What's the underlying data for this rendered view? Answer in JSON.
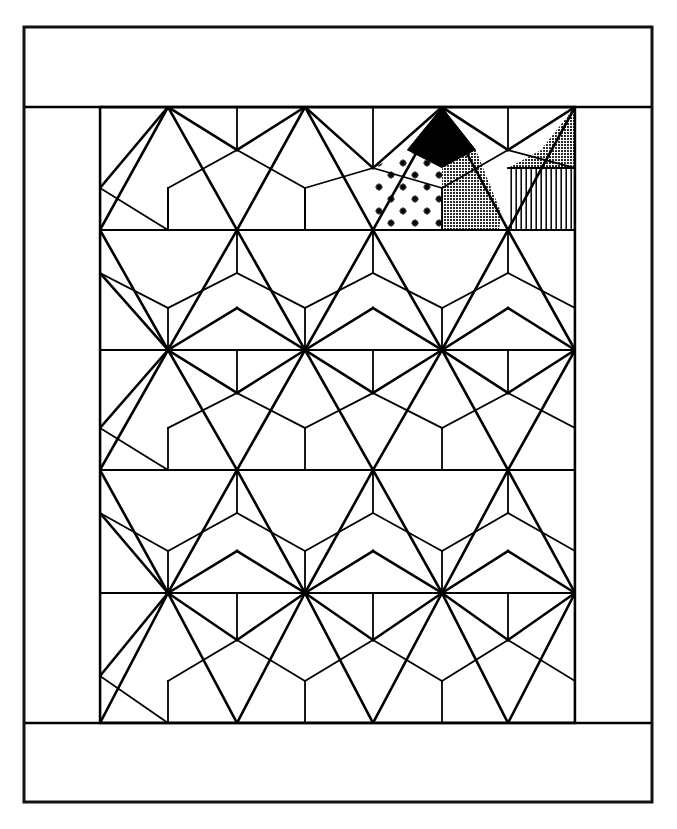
{
  "figure": {
    "kind": "line-drawing",
    "title": "",
    "caption": "",
    "background_color": "#ffffff",
    "ink_color": "#000000"
  },
  "frame": {
    "name": "outer-rectangle-border",
    "x": 24,
    "y": 27,
    "width": 628,
    "height": 775,
    "stroke_width": 3,
    "stroke_color": "#111111",
    "fill": "#ffffff"
  },
  "bands": {
    "top_band": {
      "label": "top blank band",
      "y": 27,
      "height": 80
    },
    "bottom_band": {
      "label": "bottom blank band",
      "y": 723,
      "height": 79
    }
  },
  "pattern": {
    "name": "tessellation-panel",
    "x": 100,
    "y": 107,
    "width": 475,
    "height": 616,
    "stroke_color": "#000000",
    "thin_stroke": 1.6,
    "thick_stroke": 3.0,
    "columns": 4,
    "rows": 5,
    "cell_width": 118.75,
    "cell_height": 123.2,
    "tile_types": [
      "hexagon",
      "triangle",
      "rhombus",
      "square"
    ],
    "grid_lines_horizontal": [
      107,
      230,
      350,
      470,
      593,
      723
    ],
    "grid_lines_vertical": [
      100,
      237,
      373,
      508,
      575
    ],
    "vertex_crossings_x": [
      168,
      305,
      442,
      575
    ]
  },
  "shaded_cells": [
    {
      "name": "black-triangle",
      "fill_style": "solid-black",
      "color": "#000000",
      "position": "upper-middle-right",
      "apex": [
        442,
        107
      ]
    },
    {
      "name": "gray-triangle",
      "fill_style": "solid-gray",
      "color": "#4d4d4d",
      "position": "upper-right-of-black",
      "apex": [
        442,
        107
      ]
    },
    {
      "name": "dotted-pentagon",
      "fill_style": "star-dot-texture",
      "color": "#000000",
      "position": "left-of-black",
      "dot_count": 9
    },
    {
      "name": "striped-triangle",
      "fill_style": "vertical-hatch",
      "color": "#000000",
      "position": "far-right-lower",
      "stripe_spacing": 5
    },
    {
      "name": "dark-corner-triangle",
      "fill_style": "solid-gray",
      "color": "#3a3a3a",
      "position": "top-right-corner"
    }
  ],
  "legend": {
    "entries": []
  }
}
